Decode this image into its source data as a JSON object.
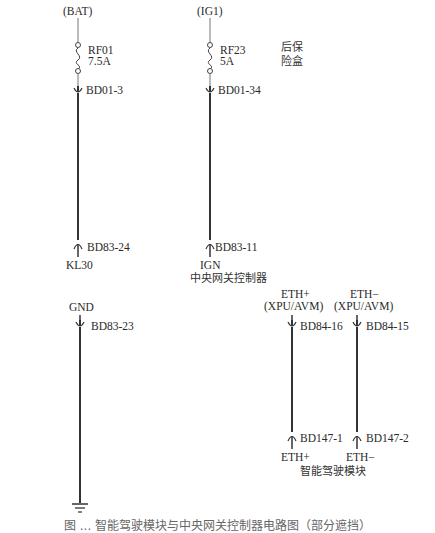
{
  "fuse_box": {
    "label_line1": "后保",
    "label_line2": "险盒",
    "sources": [
      {
        "name": "(BAT)",
        "fuse": "RF01",
        "rating": "7.5A",
        "connector": "BD01-3"
      },
      {
        "name": "(IG1)",
        "fuse": "RF23",
        "rating": "5A",
        "connector": "BD01-34"
      }
    ]
  },
  "gateway": {
    "title": "中央网关控制器",
    "inputs": [
      {
        "pin": "KL30",
        "connector": "BD83-24"
      },
      {
        "pin": "IGN",
        "connector": "BD83-11"
      }
    ],
    "outputs": [
      {
        "pin": "GND",
        "sub": "",
        "connector": "BD83-23"
      },
      {
        "pin": "ETH+",
        "sub": "(XPU/AVM)",
        "connector": "BD84-16"
      },
      {
        "pin": "ETH−",
        "sub": "(XPU/AVM)",
        "connector": "BD84-15"
      }
    ]
  },
  "adas_module": {
    "title": "智能驾驶模块",
    "pins": [
      {
        "pin": "ETH+",
        "connector": "BD147-1"
      },
      {
        "pin": "ETH−",
        "connector": "BD147-2"
      }
    ]
  },
  "ground_symbol": "ground-icon",
  "caption": "图 ... 智能驾驶模块与中央网关控制器电路图（部分遮挡）",
  "colors": {
    "wire": "#333333",
    "box_border": "#555555",
    "module_fill": "#ececec",
    "text": "#2a2a2a"
  }
}
